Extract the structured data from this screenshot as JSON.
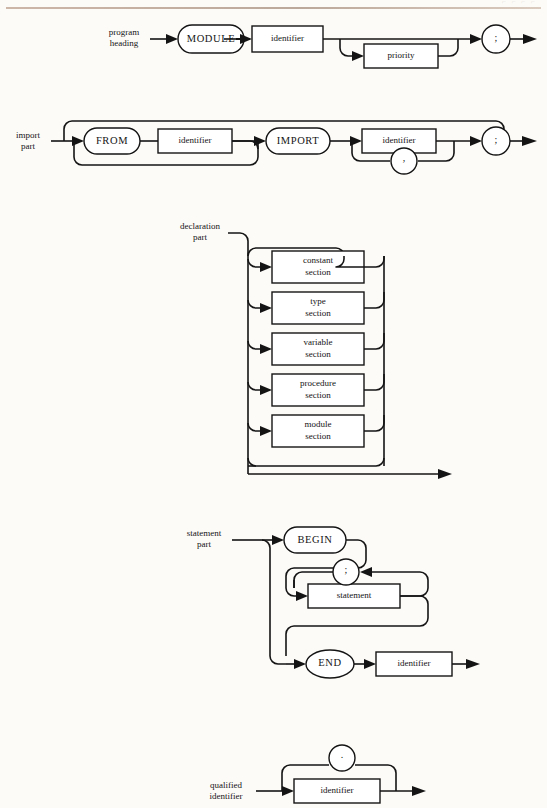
{
  "page": {
    "background_color": "#fdfbf8",
    "rule_color": "#b9a496",
    "ink_color": "#141414",
    "header_faint_text": "⌐ ⌐ ⌐   ⌐"
  },
  "diagrams": [
    {
      "id": "program-heading",
      "entry_label_line1": "program",
      "entry_label_line2": "heading",
      "nodes": [
        {
          "kind": "terminal-oval",
          "label": "MODULE"
        },
        {
          "kind": "nonterminal-box",
          "label": "identifier"
        },
        {
          "kind": "nonterminal-box",
          "label": "priority"
        },
        {
          "kind": "terminal-circle",
          "label": ";"
        }
      ]
    },
    {
      "id": "import-part",
      "entry_label_line1": "import",
      "entry_label_line2": "part",
      "nodes": [
        {
          "kind": "terminal-oval",
          "label": "FROM"
        },
        {
          "kind": "nonterminal-box",
          "label": "identifier"
        },
        {
          "kind": "terminal-oval",
          "label": "IMPORT"
        },
        {
          "kind": "nonterminal-box",
          "label": "identifier"
        },
        {
          "kind": "terminal-circle",
          "label": ","
        },
        {
          "kind": "terminal-circle",
          "label": ";"
        }
      ]
    },
    {
      "id": "declaration-part",
      "entry_label_line1": "declaration",
      "entry_label_line2": "part",
      "sections": [
        {
          "line1": "constant",
          "line2": "section"
        },
        {
          "line1": "type",
          "line2": "section"
        },
        {
          "line1": "variable",
          "line2": "section"
        },
        {
          "line1": "procedure",
          "line2": "section"
        },
        {
          "line1": "module",
          "line2": "section"
        }
      ]
    },
    {
      "id": "statement-part",
      "entry_label_line1": "statement",
      "entry_label_line2": "part",
      "nodes": [
        {
          "kind": "terminal-oval",
          "label": "BEGIN"
        },
        {
          "kind": "terminal-circle",
          "label": ";"
        },
        {
          "kind": "nonterminal-box",
          "label": "statement"
        },
        {
          "kind": "terminal-oval",
          "label": "END"
        },
        {
          "kind": "nonterminal-box",
          "label": "identifier"
        }
      ]
    },
    {
      "id": "qualified-identifier",
      "entry_label_line1": "qualified",
      "entry_label_line2": "identifier",
      "nodes": [
        {
          "kind": "terminal-circle",
          "label": "."
        },
        {
          "kind": "nonterminal-box",
          "label": "identifier"
        }
      ]
    }
  ]
}
